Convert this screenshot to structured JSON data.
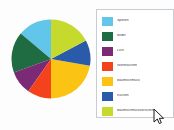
{
  "background_color": "#fdfdfd",
  "chart_data": {
    "type": "pie",
    "title": "",
    "subtitle": "",
    "xlabel": "",
    "ylabel": "",
    "grid": false,
    "legend_position": "right",
    "labels": [
      "Spielen",
      "Bilder",
      "Licht",
      "Weihnachten",
      "Baumschmuck",
      "Kuchen",
      "Baumschmuckvorschrift"
    ],
    "colors": [
      "#62c6ea",
      "#1f6b42",
      "#7b2a75",
      "#f4421c",
      "#fbc313",
      "#2a5bab",
      "#c6d92d"
    ],
    "values": [
      14,
      14,
      11,
      17,
      14,
      10,
      20
    ],
    "slice_start_angles_deg": [
      310,
      250,
      215,
      180,
      100,
      62,
      0
    ],
    "slice_sweep_deg": [
      50,
      60,
      35,
      35,
      80,
      38,
      62
    ]
  },
  "legend": {
    "border_color": "#c8cdd4",
    "background_color": "#ffffff",
    "items": [
      {
        "label": "Spielen",
        "color": "#62c6ea"
      },
      {
        "label": "Bilder",
        "color": "#1f6b42"
      },
      {
        "label": "Licht",
        "color": "#7b2a75"
      },
      {
        "label": "Weihnachten",
        "color": "#f4421c"
      },
      {
        "label": "Baumschmuck",
        "color": "#fbc313"
      },
      {
        "label": "Kuchen",
        "color": "#2a5bab"
      },
      {
        "label": "Baumschmuckvorschrift",
        "color": "#c6d92d"
      }
    ]
  },
  "cursor": {
    "icon": "mouse-pointer-icon",
    "x": 153,
    "y": 108
  }
}
